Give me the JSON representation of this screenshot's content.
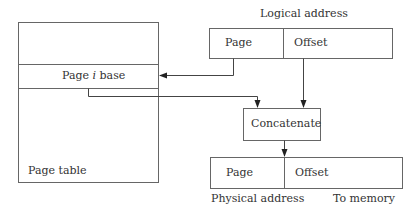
{
  "diagram": {
    "page_table": {
      "row_label_prefix": "Page ",
      "row_label_italic": "i",
      "row_label_suffix": " base",
      "caption": "Page table"
    },
    "logical_address": {
      "title": "Logical address",
      "page_label": "Page",
      "offset_label": "Offset"
    },
    "concatenate": {
      "label": "Concatenate"
    },
    "physical_address": {
      "title": "Physical address",
      "page_label": "Page",
      "offset_label": "Offset",
      "output_label": "To memory"
    },
    "line_color": "#555555"
  }
}
